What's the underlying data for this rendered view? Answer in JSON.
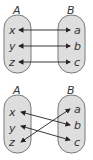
{
  "colors": {
    "set_fill": "#dedede",
    "set_stroke": "#7a7a7a",
    "arrow": "#222222",
    "text": "#333333"
  },
  "diagrams": [
    {
      "name": "one-to-one-aligned",
      "set_a": {
        "title": "A",
        "elements": [
          "x",
          "y",
          "z"
        ]
      },
      "set_b": {
        "title": "B",
        "elements": [
          "a",
          "b",
          "c"
        ]
      },
      "mappings": [
        {
          "from": "x",
          "to": "a",
          "bidirectional": true
        },
        {
          "from": "y",
          "to": "b",
          "bidirectional": true
        },
        {
          "from": "z",
          "to": "c",
          "bidirectional": true
        }
      ]
    },
    {
      "name": "one-to-one-crossed",
      "set_a": {
        "title": "A",
        "elements": [
          "x",
          "y",
          "z"
        ]
      },
      "set_b": {
        "title": "B",
        "elements": [
          "a",
          "b",
          "c"
        ]
      },
      "mappings": [
        {
          "from": "x",
          "to": "b",
          "bidirectional": true
        },
        {
          "from": "y",
          "to": "c",
          "bidirectional": true
        },
        {
          "from": "z",
          "to": "a",
          "bidirectional": true
        }
      ]
    }
  ]
}
